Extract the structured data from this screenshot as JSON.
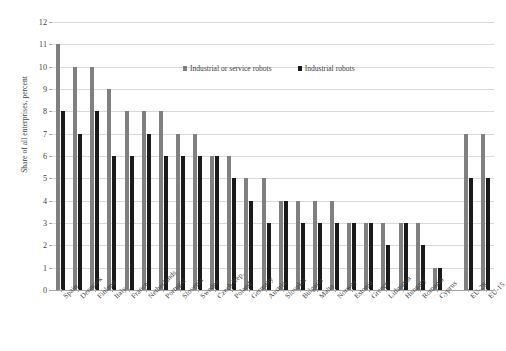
{
  "chart_data": {
    "type": "bar",
    "title": "",
    "xlabel": "",
    "ylabel": "Share of all enterprises, percent",
    "ylim": [
      0,
      12
    ],
    "ytick_step": 1,
    "yticks": [
      12,
      11,
      10,
      9,
      8,
      7,
      6,
      5,
      4,
      3,
      2,
      1,
      0
    ],
    "grid": true,
    "legend_position": "top-center",
    "categories": [
      "Spain",
      "Denmark",
      "Finland",
      "Italy",
      "France",
      "Netherlands",
      "Portugal",
      "Slovenia",
      "Sweden",
      "Czech Rep.",
      "Poland",
      "Germany",
      "Austria",
      "Slovakia",
      "Bulgaria",
      "Malta",
      "Norway",
      "Estonia",
      "Greece",
      "Lithuania",
      "Hungary",
      "Romania",
      "Cyprus",
      "",
      "EU-28",
      "EU-15"
    ],
    "series": [
      {
        "name": "Industrial or service robots",
        "color": "#808080",
        "values": [
          11,
          10,
          10,
          9,
          8,
          8,
          8,
          7,
          7,
          6,
          6,
          5,
          5,
          4,
          4,
          4,
          4,
          3,
          3,
          3,
          3,
          3,
          1,
          null,
          7,
          7
        ]
      },
      {
        "name": "Industrial robots",
        "color": "#1a1a1a",
        "values": [
          8,
          7,
          8,
          6,
          6,
          7,
          6,
          6,
          6,
          6,
          5,
          4,
          3,
          4,
          3,
          3,
          3,
          3,
          3,
          2,
          3,
          2,
          1,
          null,
          5,
          5
        ]
      }
    ]
  },
  "legend": {
    "entries": [
      {
        "label": "Industrial or service robots",
        "color": "#808080"
      },
      {
        "label": "Industrial robots",
        "color": "#1a1a1a"
      }
    ]
  },
  "axis": {
    "y_title": "Share of all enterprises, percent"
  },
  "colors": {
    "series_total": "#808080",
    "series_industrial": "#1a1a1a",
    "gridline": "#d9d9d9",
    "axis": "#a6a6a6",
    "text": "#3f3f3f",
    "background": "#ffffff"
  }
}
